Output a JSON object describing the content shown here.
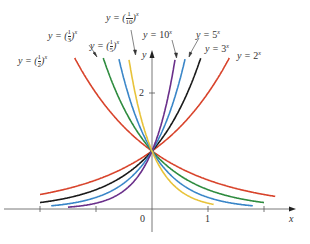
{
  "chart_data": {
    "type": "line",
    "title": "",
    "xlabel": "x",
    "ylabel": "y",
    "x_ticks": [
      "0",
      "1"
    ],
    "y_ticks": [
      "2"
    ],
    "grid": false,
    "series": [
      {
        "name": "y = 2^x",
        "base": 2,
        "color": "#d8432b",
        "label_pos": [
          237,
          47
        ]
      },
      {
        "name": "y = 3^x",
        "base": 3,
        "color": "#1a1a1a",
        "label_pos": [
          205,
          43
        ]
      },
      {
        "name": "y = 5^x",
        "base": 5,
        "color": "#3a86c8",
        "label_pos": [
          196,
          30
        ]
      },
      {
        "name": "y = 10^x",
        "base": 10,
        "color": "#6a2f8a",
        "label_pos": [
          143,
          30
        ]
      },
      {
        "name": "y = (1/2)^x",
        "base": 0.5,
        "color": "#d8432b",
        "label_pos": [
          18,
          54
        ]
      },
      {
        "name": "y = (1/3)^x",
        "base": 0.3333,
        "color": "#2e8b3e",
        "label_pos": [
          48,
          29
        ]
      },
      {
        "name": "y = (1/5)^x",
        "base": 0.2,
        "color": "#3a86c8",
        "label_pos": [
          90,
          39
        ]
      },
      {
        "name": "y = (1/10)^x",
        "base": 0.1,
        "color": "#e8c33a",
        "label_pos": [
          106,
          17
        ]
      }
    ],
    "xlim": [
      -2.7,
      2.9
    ],
    "ylim": [
      -0.4,
      3.0
    ]
  },
  "labels": {
    "y2": {
      "pre": "y = ",
      "base": "2",
      "exp": "x"
    },
    "y3": {
      "pre": "y = ",
      "base": "3",
      "exp": "x"
    },
    "y5": {
      "pre": "y = ",
      "base": "5",
      "exp": "x"
    },
    "y10": {
      "pre": "y = ",
      "base": "10",
      "exp": "x"
    },
    "yhalf": {
      "pre": "y = ",
      "num": "1",
      "den": "2",
      "exp": "x"
    },
    "ythird": {
      "pre": "y = ",
      "num": "1",
      "den": "3",
      "exp": "x"
    },
    "yfifth": {
      "pre": "y = ",
      "num": "1",
      "den": "5",
      "exp": "x"
    },
    "ytenth": {
      "pre": "y = ",
      "num": "1",
      "den": "10",
      "exp": "x"
    }
  },
  "axes": {
    "x_label": "x",
    "y_label": "y",
    "origin": "0",
    "x_one": "1",
    "y_two": "2"
  }
}
